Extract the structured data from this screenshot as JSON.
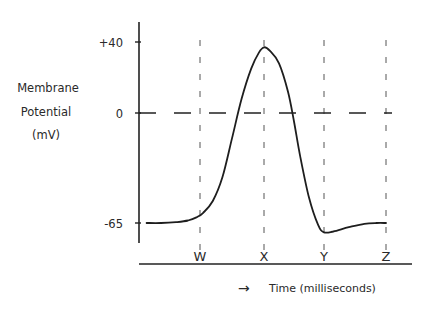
{
  "chart_data": {
    "type": "line",
    "title": "",
    "ylabel": [
      "Membrane",
      "Potential",
      "(mV)"
    ],
    "xlabel": "Time (milliseconds)",
    "xlabel_arrow": "→",
    "ylim": [
      -75,
      48
    ],
    "y_ticks": [
      {
        "value": 40,
        "label": "+40"
      },
      {
        "value": 0,
        "label": "0"
      },
      {
        "value": -65,
        "label": "-65"
      }
    ],
    "x_markers": [
      {
        "t": 1.0,
        "label": "W"
      },
      {
        "t": 2.0,
        "label": "X"
      },
      {
        "t": 3.0,
        "label": "Y"
      },
      {
        "t": 4.0,
        "label": "Z"
      }
    ],
    "xlim": [
      -0.8,
      4.4
    ],
    "reference_line": {
      "value": 0,
      "style": "dashed"
    },
    "series": [
      {
        "name": "Membrane potential",
        "points": [
          [
            -0.78,
            -65
          ],
          [
            -0.3,
            -65
          ],
          [
            0.2,
            -64.5
          ],
          [
            0.6,
            -63.5
          ],
          [
            0.9,
            -61.5
          ],
          [
            1.05,
            -59
          ],
          [
            1.2,
            -52
          ],
          [
            1.35,
            -38
          ],
          [
            1.5,
            -15
          ],
          [
            1.65,
            8
          ],
          [
            1.8,
            25
          ],
          [
            1.92,
            34
          ],
          [
            2.0,
            37
          ],
          [
            2.1,
            35
          ],
          [
            2.25,
            28
          ],
          [
            2.4,
            12
          ],
          [
            2.5,
            -5
          ],
          [
            2.6,
            -25
          ],
          [
            2.75,
            -50
          ],
          [
            2.9,
            -66
          ],
          [
            3.0,
            -70.5
          ],
          [
            3.15,
            -70
          ],
          [
            3.4,
            -67.5
          ],
          [
            3.65,
            -65.5
          ],
          [
            3.85,
            -65
          ],
          [
            4.0,
            -65
          ]
        ]
      }
    ]
  }
}
